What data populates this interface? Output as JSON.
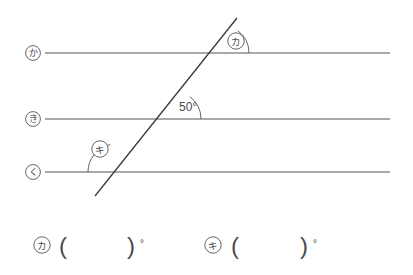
{
  "figure": {
    "type": "geometry-diagram",
    "background_color": "#ffffff",
    "line_color": "#555555",
    "text_color": "#4a4a4a",
    "parallel_lines": [
      {
        "id": "line-ka",
        "label": "か",
        "label_kind": "circled-hiragana",
        "y": 53,
        "x_start": 45,
        "x_end": 390
      },
      {
        "id": "line-ki",
        "label": "き",
        "label_kind": "circled-hiragana",
        "y": 119,
        "x_start": 45,
        "x_end": 390
      },
      {
        "id": "line-ku",
        "label": "く",
        "label_kind": "circled-hiragana",
        "y": 172,
        "x_start": 45,
        "x_end": 390
      }
    ],
    "transversal": {
      "id": "transversal-line",
      "x1": 95,
      "y1": 196,
      "x2": 237,
      "y2": 18
    },
    "angles": [
      {
        "id": "angle-ka-marked",
        "label": "カ",
        "label_kind": "circled-katakana",
        "value": "",
        "unit": "°",
        "vertex_x": 221,
        "vertex_y": 53,
        "label_x": 236,
        "label_y": 41
      },
      {
        "id": "angle-50",
        "label": "50°",
        "label_kind": "measure",
        "value": "50",
        "unit": "°",
        "vertex_x": 173,
        "vertex_y": 119,
        "label_x": 180,
        "label_y": 110
      },
      {
        "id": "angle-ki-marked",
        "label": "キ",
        "label_kind": "circled-katakana",
        "value": "",
        "unit": "°",
        "vertex_x": 116,
        "vertex_y": 172,
        "label_x": 100,
        "label_y": 149
      }
    ]
  },
  "answers": {
    "items": [
      {
        "id": "answer-ka",
        "label": "カ",
        "open_paren": "(",
        "value": "",
        "close_paren": ")",
        "unit": "°"
      },
      {
        "id": "answer-ki",
        "label": "キ",
        "open_paren": "(",
        "value": "",
        "close_paren": ")",
        "unit": "°"
      }
    ]
  }
}
